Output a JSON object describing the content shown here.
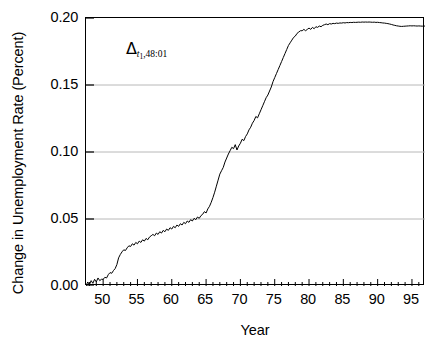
{
  "chart_data": {
    "type": "line",
    "title": "",
    "xlabel": "Year",
    "ylabel": "Change in Unemployment Rate (Percent)",
    "xlim": [
      47.5,
      96.9
    ],
    "ylim": [
      0.0,
      0.2
    ],
    "xticks": [
      50,
      55,
      60,
      65,
      70,
      75,
      80,
      85,
      90,
      95
    ],
    "xtick_labels": [
      "50",
      "55",
      "60",
      "65",
      "70",
      "75",
      "80",
      "85",
      "90",
      "95"
    ],
    "yticks": [
      0.0,
      0.05,
      0.1,
      0.15,
      0.2
    ],
    "ytick_labels": [
      "0.00",
      "0.05",
      "0.10",
      "0.15",
      "0.20"
    ],
    "xtick_minor_step": 1,
    "grid": "horizontal-only, light gray at 0.05, 0.10, 0.15",
    "legend": "none",
    "line_color": "#000000",
    "line_width": 1.0,
    "annotations": [
      {
        "text": "Δ t1,48:01",
        "delta": "Δ",
        "subscript_italic": "t",
        "subscript_sub": "1",
        "subscript_rest": ",48:01",
        "x": 55.5,
        "y": 0.176
      }
    ],
    "series": [
      {
        "name": "Change in Unemployment Rate",
        "x": [
          47.5,
          47.75,
          48.0,
          48.25,
          48.5,
          48.75,
          49.0,
          49.25,
          49.5,
          49.75,
          50.0,
          50.25,
          50.5,
          50.75,
          51.0,
          51.25,
          51.5,
          51.75,
          52.0,
          52.25,
          52.5,
          52.75,
          53.0,
          53.25,
          53.5,
          53.75,
          54.0,
          54.25,
          54.5,
          54.75,
          55.0,
          55.25,
          55.5,
          55.75,
          56.0,
          56.25,
          56.5,
          56.75,
          57.0,
          57.25,
          57.5,
          57.75,
          58.0,
          58.25,
          58.5,
          58.75,
          59.0,
          59.25,
          59.5,
          59.75,
          60.0,
          60.25,
          60.5,
          60.75,
          61.0,
          61.25,
          61.5,
          61.75,
          62.0,
          62.25,
          62.5,
          62.75,
          63.0,
          63.25,
          63.5,
          63.75,
          64.0,
          64.25,
          64.5,
          64.75,
          65.0,
          65.25,
          65.5,
          65.75,
          66.0,
          66.25,
          66.5,
          66.75,
          67.0,
          67.25,
          67.5,
          67.75,
          68.0,
          68.25,
          68.5,
          68.75,
          69.0,
          69.25,
          69.5,
          69.75,
          70.0,
          70.25,
          70.5,
          70.75,
          71.0,
          71.25,
          71.5,
          71.75,
          72.0,
          72.25,
          72.5,
          72.75,
          73.0,
          73.25,
          73.5,
          73.75,
          74.0,
          74.25,
          74.5,
          74.75,
          75.0,
          75.25,
          75.5,
          75.75,
          76.0,
          76.25,
          76.5,
          76.75,
          77.0,
          77.25,
          77.5,
          77.75,
          78.0,
          78.25,
          78.5,
          78.75,
          79.0,
          79.25,
          79.5,
          79.75,
          80.0,
          80.25,
          80.5,
          80.75,
          81.0,
          81.25,
          81.5,
          81.75,
          82.0,
          82.25,
          82.5,
          82.75,
          83.0,
          83.25,
          83.5,
          83.75,
          84.0,
          84.25,
          84.5,
          84.75,
          85.0,
          85.25,
          85.5,
          85.75,
          86.0,
          86.25,
          86.5,
          86.75,
          87.0,
          87.25,
          87.5,
          87.75,
          88.0,
          88.25,
          88.5,
          88.75,
          89.0,
          89.25,
          89.5,
          89.75,
          90.0,
          90.25,
          90.5,
          90.75,
          91.0,
          91.25,
          91.5,
          91.75,
          92.0,
          92.25,
          92.5,
          92.75,
          93.0,
          93.25,
          93.5,
          93.75,
          94.0,
          94.25,
          94.5,
          94.75,
          95.0,
          95.25,
          95.5,
          95.75,
          96.0,
          96.25,
          96.5,
          96.9
        ],
        "y": [
          0.0,
          0.003,
          0.001,
          0.004,
          0.002,
          0.005,
          0.003,
          0.006,
          0.004,
          0.005,
          0.005,
          0.0065,
          0.006,
          0.0085,
          0.01,
          0.0095,
          0.0115,
          0.013,
          0.016,
          0.021,
          0.0235,
          0.0255,
          0.027,
          0.0265,
          0.0285,
          0.03,
          0.0295,
          0.0315,
          0.0305,
          0.0325,
          0.0315,
          0.0335,
          0.0325,
          0.0345,
          0.0335,
          0.0355,
          0.0345,
          0.0365,
          0.0375,
          0.0385,
          0.0375,
          0.0395,
          0.0385,
          0.0405,
          0.0395,
          0.0415,
          0.0405,
          0.0425,
          0.0415,
          0.0435,
          0.0425,
          0.0445,
          0.0435,
          0.0455,
          0.0445,
          0.0465,
          0.0455,
          0.0475,
          0.0465,
          0.0485,
          0.0475,
          0.0495,
          0.0485,
          0.0505,
          0.0495,
          0.0515,
          0.0505,
          0.0525,
          0.0535,
          0.0555,
          0.0545,
          0.0575,
          0.0595,
          0.0625,
          0.066,
          0.07,
          0.0745,
          0.079,
          0.0835,
          0.086,
          0.0885,
          0.0925,
          0.0955,
          0.0985,
          0.101,
          0.1035,
          0.1025,
          0.1055,
          0.1015,
          0.1045,
          0.1065,
          0.1095,
          0.1085,
          0.1115,
          0.1135,
          0.1165,
          0.1185,
          0.1215,
          0.1235,
          0.1265,
          0.1255,
          0.1285,
          0.1315,
          0.1345,
          0.1375,
          0.1405,
          0.1425,
          0.1455,
          0.1485,
          0.1525,
          0.1555,
          0.1585,
          0.1615,
          0.1645,
          0.1675,
          0.1705,
          0.1735,
          0.1765,
          0.1795,
          0.1815,
          0.1835,
          0.1855,
          0.1865,
          0.1885,
          0.1895,
          0.1905,
          0.1905,
          0.1915,
          0.1905,
          0.1915,
          0.1925,
          0.1915,
          0.193,
          0.192,
          0.1935,
          0.193,
          0.194,
          0.1935,
          0.1945,
          0.195,
          0.1955,
          0.195,
          0.1958,
          0.1955,
          0.196,
          0.1958,
          0.1962,
          0.196,
          0.1963,
          0.1962,
          0.1965,
          0.1963,
          0.1966,
          0.1965,
          0.1967,
          0.1966,
          0.1968,
          0.1967,
          0.1968,
          0.1969,
          0.1968,
          0.197,
          0.1969,
          0.197,
          0.1969,
          0.197,
          0.1969,
          0.1968,
          0.1969,
          0.1967,
          0.1968,
          0.1966,
          0.1965,
          0.1963,
          0.1962,
          0.196,
          0.1958,
          0.1955,
          0.1952,
          0.1948,
          0.1945,
          0.1942,
          0.194,
          0.1938,
          0.1937,
          0.1938,
          0.1939,
          0.194,
          0.1941,
          0.1942,
          0.1941,
          0.1942,
          0.1941,
          0.194,
          0.1941,
          0.194,
          0.1939,
          0.194
        ]
      }
    ]
  }
}
